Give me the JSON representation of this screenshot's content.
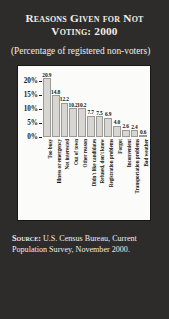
{
  "figure": {
    "title": "Reasons Given for Not Voting: 2000",
    "subtitle": "(Percentage of registered non-voters)",
    "source_label": "Source:",
    "source_text": "U.S. Census Bureau, Current Population Survey, November 2000.",
    "background_color": "#2e2c2b",
    "panel_color": "#fbfbf9",
    "bar_color": "#d7d6d2",
    "text_color": "#f2efe9"
  },
  "chart_data": {
    "type": "bar",
    "title": "Reasons Given for Not Voting: 2000",
    "subtitle": "(Percentage of registered non-voters)",
    "xlabel": "",
    "ylabel": "",
    "ylim": [
      0,
      22
    ],
    "grid": false,
    "legend": "none",
    "ytick_labels": [
      "0%",
      "5%",
      "10%",
      "15%",
      "20%"
    ],
    "ytick_values": [
      0,
      5,
      10,
      15,
      20
    ],
    "categories": [
      "Too busy",
      "Illness or emergency",
      "Not interested",
      "Out of town",
      "Other reason",
      "Didn't like candidates",
      "Refused, don't know",
      "Registration problems",
      "Forgot",
      "Inconvenient",
      "Transportation problems",
      "Bad weather"
    ],
    "values": [
      20.9,
      14.8,
      12.2,
      10.2,
      10.2,
      7.7,
      7.5,
      6.9,
      4.0,
      2.6,
      2.4,
      0.6
    ],
    "value_labels": [
      "20.9",
      "14.8",
      "12.2",
      "10.2",
      "10.2",
      "7.7",
      "7.5",
      "6.9",
      "4.0",
      "2.6",
      "2.4",
      "0.6"
    ]
  }
}
